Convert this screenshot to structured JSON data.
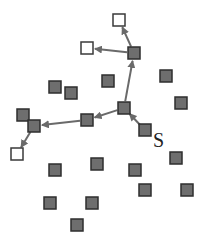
{
  "diagram": {
    "type": "graph-traversal",
    "width": 201,
    "height": 246,
    "colors": {
      "gray_node_fill": "#6e6e6e",
      "gray_node_stroke": "#2e2e2e",
      "white_node_fill": "#ffffff",
      "white_node_stroke": "#3a3a3a",
      "edge": "#6a6a6a",
      "label": "#222222"
    },
    "node_size": 12,
    "source_label": {
      "text": "S",
      "x": 153,
      "y": 147
    },
    "nodes": [
      {
        "id": "w1",
        "x": 119,
        "y": 20,
        "kind": "white"
      },
      {
        "id": "w2",
        "x": 87,
        "y": 48,
        "kind": "white"
      },
      {
        "id": "w3",
        "x": 17,
        "y": 154,
        "kind": "white"
      },
      {
        "id": "g1",
        "x": 134,
        "y": 53,
        "kind": "gray"
      },
      {
        "id": "g2",
        "x": 108,
        "y": 81,
        "kind": "gray"
      },
      {
        "id": "g3",
        "x": 55,
        "y": 87,
        "kind": "gray"
      },
      {
        "id": "g4",
        "x": 71,
        "y": 93,
        "kind": "gray"
      },
      {
        "id": "g5",
        "x": 166,
        "y": 76,
        "kind": "gray"
      },
      {
        "id": "g6",
        "x": 181,
        "y": 103,
        "kind": "gray"
      },
      {
        "id": "g7",
        "x": 124,
        "y": 108,
        "kind": "gray"
      },
      {
        "id": "g8",
        "x": 87,
        "y": 120,
        "kind": "gray"
      },
      {
        "id": "g9",
        "x": 23,
        "y": 115,
        "kind": "gray"
      },
      {
        "id": "g10",
        "x": 34,
        "y": 126,
        "kind": "gray"
      },
      {
        "id": "S",
        "x": 145,
        "y": 130,
        "kind": "gray"
      },
      {
        "id": "g11",
        "x": 176,
        "y": 158,
        "kind": "gray"
      },
      {
        "id": "g12",
        "x": 55,
        "y": 170,
        "kind": "gray"
      },
      {
        "id": "g13",
        "x": 97,
        "y": 164,
        "kind": "gray"
      },
      {
        "id": "g14",
        "x": 135,
        "y": 170,
        "kind": "gray"
      },
      {
        "id": "g15",
        "x": 145,
        "y": 190,
        "kind": "gray"
      },
      {
        "id": "g16",
        "x": 187,
        "y": 190,
        "kind": "gray"
      },
      {
        "id": "g17",
        "x": 50,
        "y": 203,
        "kind": "gray"
      },
      {
        "id": "g18",
        "x": 92,
        "y": 203,
        "kind": "gray"
      },
      {
        "id": "g19",
        "x": 77,
        "y": 225,
        "kind": "gray"
      }
    ],
    "edges": [
      {
        "from": "S",
        "to": "g7"
      },
      {
        "from": "g7",
        "to": "g1"
      },
      {
        "from": "g1",
        "to": "w1"
      },
      {
        "from": "g1",
        "to": "w2"
      },
      {
        "from": "g7",
        "to": "g8"
      },
      {
        "from": "g8",
        "to": "g10"
      },
      {
        "from": "g10",
        "to": "w3"
      }
    ]
  }
}
